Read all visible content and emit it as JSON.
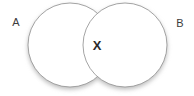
{
  "figure": {
    "type": "venn-diagram",
    "width": 194,
    "height": 96,
    "background_color": "#ffffff",
    "circle_fill": "#ffffff",
    "circle_stroke": "#9a9a9a",
    "label_color": "#3c3c3c",
    "intersection_label_color": "#2b2b2b",
    "shadow_color": "#bdbdbd"
  },
  "sets": [
    {
      "id": "set-a",
      "label": "A",
      "label_x": 16,
      "label_y": 26,
      "center_x": 70,
      "center_y": 45,
      "radius": 42
    },
    {
      "id": "set-b",
      "label": "B",
      "label_x": 180,
      "label_y": 27,
      "center_x": 125,
      "center_y": 45,
      "radius": 42
    }
  ],
  "intersection": {
    "label": "X",
    "label_x": 97,
    "label_y": 50
  }
}
